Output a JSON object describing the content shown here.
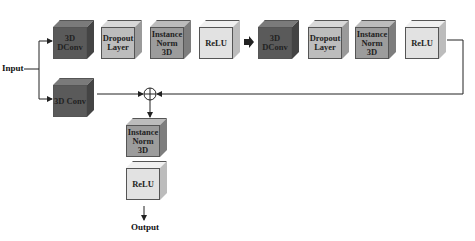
{
  "diagram": {
    "input_label": "Input",
    "output_label": "Output",
    "sum_symbol": "⊕",
    "top_branch": [
      {
        "label": "3D DConv",
        "front": "#5a5a5a",
        "top": "#7a7a7a",
        "side": "#444444"
      },
      {
        "label": "Dropout Layer",
        "front": "#bdbdbd",
        "top": "#d8d8d8",
        "side": "#9a9a9a"
      },
      {
        "label": "Instance Norm 3D",
        "front": "#9c9c9c",
        "top": "#bcbcbc",
        "side": "#7d7d7d"
      },
      {
        "label": "ReLU",
        "front": "#e2e2e2",
        "top": "#f0f0f0",
        "side": "#bcbcbc"
      },
      {
        "label": "3D DConv",
        "front": "#5a5a5a",
        "top": "#7a7a7a",
        "side": "#444444"
      },
      {
        "label": "Dropout Layer",
        "front": "#bdbdbd",
        "top": "#d8d8d8",
        "side": "#9a9a9a"
      },
      {
        "label": "Instance Norm 3D",
        "front": "#9c9c9c",
        "top": "#bcbcbc",
        "side": "#7d7d7d"
      },
      {
        "label": "ReLU",
        "front": "#e2e2e2",
        "top": "#f0f0f0",
        "side": "#bcbcbc"
      }
    ],
    "skip_branch": {
      "label": "3D Conv",
      "front": "#5a5a5a",
      "top": "#7a7a7a",
      "side": "#444444"
    },
    "output_stack": [
      {
        "label": "Instance Norm 3D",
        "front": "#9c9c9c",
        "top": "#bcbcbc",
        "side": "#7d7d7d"
      },
      {
        "label": "ReLU",
        "front": "#e2e2e2",
        "top": "#f0f0f0",
        "side": "#bcbcbc"
      }
    ]
  }
}
